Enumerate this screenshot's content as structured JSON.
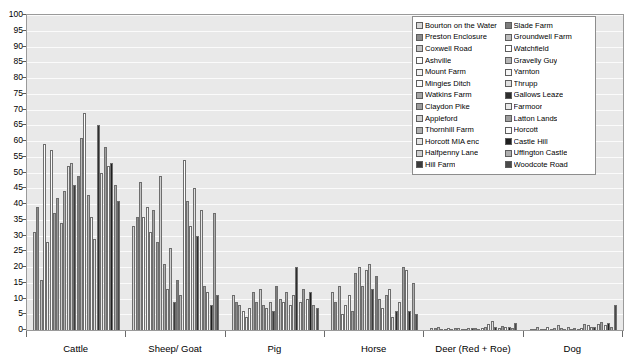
{
  "chart_data": {
    "type": "bar",
    "title": "",
    "xlabel": "",
    "ylabel": "",
    "ylim": [
      0,
      100
    ],
    "ytick_step": 5,
    "yticks": [
      0,
      5,
      10,
      15,
      20,
      25,
      30,
      35,
      40,
      45,
      50,
      55,
      60,
      65,
      70,
      75,
      80,
      85,
      90,
      95,
      100
    ],
    "grid": true,
    "legend_position": "top-right",
    "categories": [
      "Cattle",
      "Sheep/ Goat",
      "Pig",
      "Horse",
      "Deer (Red + Roe)",
      "Dog"
    ],
    "series": [
      {
        "name": "Bourton on the Water",
        "color": "#d6d6d6",
        "values": [
          31,
          33,
          11,
          12,
          0.6,
          0.4
        ]
      },
      {
        "name": "Preston Enclosure",
        "color": "#8a8a8a",
        "values": [
          39,
          36,
          9,
          9,
          0.5,
          0.3
        ]
      },
      {
        "name": "Coxwell Road",
        "color": "#c2c2c2",
        "values": [
          16,
          47,
          8,
          14,
          1.0,
          0.8
        ]
      },
      {
        "name": "Ashville",
        "color": "#fdfdfd",
        "values": [
          59,
          36,
          6,
          5,
          0.3,
          0.2
        ]
      },
      {
        "name": "Mount Farm",
        "color": "#f2f2f2",
        "values": [
          28,
          39,
          4,
          8,
          0.4,
          0.4
        ]
      },
      {
        "name": "Mingies Ditch",
        "color": "#fbfbfb",
        "values": [
          57,
          31,
          7,
          11,
          0.6,
          0.9
        ]
      },
      {
        "name": "Watkins Farm",
        "color": "#a5a5a5",
        "values": [
          37,
          38,
          12,
          6,
          0.4,
          0.3
        ]
      },
      {
        "name": "Claydon Pike",
        "color": "#9b9b9b",
        "values": [
          42,
          28,
          9,
          18,
          0.5,
          0.5
        ]
      },
      {
        "name": "Appleford",
        "color": "#d0d0d0",
        "values": [
          34,
          49,
          13,
          20,
          0.7,
          1.6
        ]
      },
      {
        "name": "Thornhill Farm",
        "color": "#b0b0b0",
        "values": [
          44,
          21,
          8,
          14,
          0.4,
          0.5
        ]
      },
      {
        "name": "Horcott MIA enc",
        "color": "#e4e4e4",
        "values": [
          52,
          13,
          7,
          19,
          0.3,
          0.3
        ]
      },
      {
        "name": "Halfpenny Lane",
        "color": "#cfcfcf",
        "values": [
          53,
          26,
          9,
          21,
          0.6,
          0.9
        ]
      },
      {
        "name": "Hill Farm",
        "color": "#3b3b3b",
        "values": [
          46,
          9,
          6,
          13,
          0.5,
          0.4
        ]
      },
      {
        "name": "Slade Farm",
        "color": "#7d7d7d",
        "values": [
          49,
          16,
          14,
          17,
          0.6,
          0.5
        ]
      },
      {
        "name": "Groundwell Farm",
        "color": "#bcbcbc",
        "values": [
          61,
          11,
          10,
          10,
          0.4,
          0.3
        ]
      },
      {
        "name": "Watchfield",
        "color": "#ffffff",
        "values": [
          69,
          54,
          9,
          7,
          0.5,
          0.6
        ]
      },
      {
        "name": "Gravelly Guy",
        "color": "#b6b6b6",
        "values": [
          43,
          41,
          12,
          11,
          1.0,
          2.0
        ]
      },
      {
        "name": "Yarnton",
        "color": "#f6f6f6",
        "values": [
          36,
          33,
          8,
          13,
          1.8,
          1.5
        ]
      },
      {
        "name": "Thrupp",
        "color": "#e0e0e0",
        "values": [
          29,
          45,
          11,
          4,
          3.0,
          1.1
        ]
      },
      {
        "name": "Gallows Leaze",
        "color": "#2e2e2e",
        "values": [
          65,
          30,
          20,
          6,
          0.9,
          0.8
        ]
      },
      {
        "name": "Farmoor",
        "color": "#e8e8e8",
        "values": [
          50,
          38,
          9,
          9,
          0.6,
          1.9
        ]
      },
      {
        "name": "Latton Lands",
        "color": "#9e9e9e",
        "values": [
          58,
          14,
          13,
          20,
          1.2,
          2.6
        ]
      },
      {
        "name": "Horcott",
        "color": "#fafafa",
        "values": [
          52,
          12,
          10,
          19,
          0.8,
          1.6
        ]
      },
      {
        "name": "Castle Hill",
        "color": "#1f1f1f",
        "values": [
          53,
          8,
          12,
          6,
          1.1,
          2.1
        ]
      },
      {
        "name": "Uffington Castle",
        "color": "#aeaeae",
        "values": [
          46,
          37,
          8,
          15,
          0.7,
          0.9
        ]
      },
      {
        "name": "Woodcote Road",
        "color": "#4a4a4a",
        "values": [
          41,
          11,
          7,
          5,
          2.1,
          8.0
        ]
      }
    ]
  },
  "legend": {
    "columns": [
      {
        "items": [
          "Bourton on the Water",
          "Preston Enclosure",
          "Coxwell Road",
          "Ashville",
          "Mount Farm",
          "Mingies Ditch",
          "Watkins Farm",
          "Claydon Pike",
          "Appleford",
          "Thornhill Farm",
          "Horcott MIA enc",
          "Halfpenny Lane",
          "Hill Farm"
        ]
      },
      {
        "items": [
          "Slade Farm",
          "Groundwell Farm",
          "Watchfield",
          "Gravelly Guy",
          "Yarnton",
          "Thrupp",
          "Gallows Leaze",
          "Farmoor",
          "Latton Lands",
          "Horcott",
          "Castle Hill",
          "Uffington Castle",
          "Woodcote Road"
        ]
      }
    ]
  },
  "axis": {
    "y_labels": [
      "100",
      "95",
      "90",
      "85",
      "80",
      "75",
      "70",
      "65",
      "60",
      "55",
      "50",
      "45",
      "40",
      "35",
      "30",
      "25",
      "20",
      "15",
      "10",
      "5",
      "0"
    ],
    "x_labels": [
      "Cattle",
      "Sheep/ Goat",
      "Pig",
      "Horse",
      "Deer (Red + Roe)",
      "Dog"
    ]
  }
}
